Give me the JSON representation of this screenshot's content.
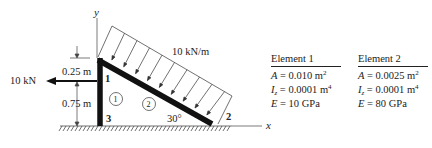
{
  "diagram": {
    "axes": {
      "x_label": "x",
      "y_label": "y"
    },
    "load": {
      "distributed": "10 kN/m",
      "point": "10 kN"
    },
    "dimensions": {
      "upper": "0.25 m",
      "lower": "0.75 m"
    },
    "angle": "30°",
    "nodes": [
      "1",
      "2",
      "3"
    ],
    "elements": [
      "1",
      "2"
    ]
  },
  "element1": {
    "title": "Element 1",
    "A_sym": "A",
    "A_val": " = 0.010 m",
    "A_exp": "2",
    "I_sym": "I",
    "I_sub": "z",
    "I_val": " = 0.0001 m",
    "I_exp": "4",
    "E_sym": "E",
    "E_val": " = 10 GPa"
  },
  "element2": {
    "title": "Element 2",
    "A_sym": "A",
    "A_val": " = 0.0025 m",
    "A_exp": "2",
    "I_sym": "I",
    "I_sub": "z",
    "I_val": " = 0.0001 m",
    "I_exp": "4",
    "E_sym": "E",
    "E_val": " = 80 GPa"
  },
  "colors": {
    "line": "#222222",
    "background": "#ffffff"
  }
}
